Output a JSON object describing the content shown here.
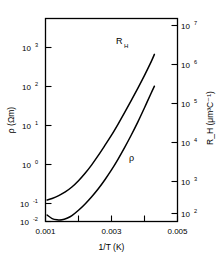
{
  "chart_data": {
    "type": "line",
    "title": "",
    "xlabel": "1/T (K)",
    "ylabel_left": "ρ (Ωm)",
    "ylabel_right": "R_H (μm³C⁻¹)",
    "xlim": [
      0.001,
      0.005
    ],
    "xticks": [
      0.001,
      0.002,
      0.003,
      0.004,
      0.005
    ],
    "xtick_labels": [
      "0.001",
      "",
      "0.003",
      "",
      "0.005"
    ],
    "left_axis": {
      "label_base": "ρ",
      "label_units": "(Ωm)",
      "scale": "log",
      "ylim": [
        0.01,
        10000
      ],
      "ticks": [
        {
          "mantissa": "10",
          "exponent": "3",
          "value": 1000
        },
        {
          "mantissa": "10",
          "exponent": "2",
          "value": 100
        },
        {
          "mantissa": "10",
          "exponent": "1",
          "value": 10
        },
        {
          "mantissa": "10",
          "exponent": "0",
          "value": 1
        },
        {
          "mantissa": "10",
          "exponent": "-1",
          "value": 0.1
        },
        {
          "mantissa": "10",
          "exponent": "-2",
          "value": 0.01
        }
      ]
    },
    "right_axis": {
      "label_base": "R",
      "label_subscript": "H",
      "label_units": "(μm³C⁻¹)",
      "scale": "log",
      "ylim": [
        10,
        100000000
      ],
      "ticks": [
        {
          "mantissa": "10",
          "exponent": "7",
          "value": 10000000
        },
        {
          "mantissa": "10",
          "exponent": "6",
          "value": 1000000
        },
        {
          "mantissa": "10",
          "exponent": "5",
          "value": 100000
        },
        {
          "mantissa": "10",
          "exponent": "4",
          "value": 10000
        },
        {
          "mantissa": "10",
          "exponent": "3",
          "value": 1000
        },
        {
          "mantissa": "10",
          "exponent": "2",
          "value": 100
        }
      ]
    },
    "grid": false,
    "legend": "inline-annotations",
    "series": [
      {
        "name": "R_H",
        "annotation": "R",
        "annotation_subscript": "H",
        "axis": "right",
        "comment": "Hall coefficient vs inverse temperature; rises steeply, exits top of frame",
        "x": [
          0.00105,
          0.0012,
          0.0014,
          0.0016,
          0.0018,
          0.002,
          0.0022,
          0.0024,
          0.0026,
          0.0028,
          0.003,
          0.0032,
          0.0034,
          0.0036,
          0.0038,
          0.004,
          0.0042,
          0.0043
        ],
        "y": [
          55,
          62,
          78,
          105,
          155,
          255,
          460,
          900,
          1900,
          4200,
          9500,
          23000,
          58000,
          150000,
          400000,
          1100000,
          3200000,
          5800000
        ]
      },
      {
        "name": "rho",
        "annotation": "ρ",
        "axis": "left",
        "comment": "Resistivity vs inverse temperature; shallow minimum near 1/T = 0.0015 then steep rise",
        "x": [
          0.00105,
          0.0012,
          0.00135,
          0.0015,
          0.00165,
          0.0018,
          0.002,
          0.0022,
          0.0024,
          0.0026,
          0.0028,
          0.003,
          0.0032,
          0.0034,
          0.0036,
          0.0038,
          0.004,
          0.0042,
          0.0043
        ],
        "y": [
          0.0155,
          0.0122,
          0.0112,
          0.0112,
          0.0125,
          0.015,
          0.0215,
          0.033,
          0.054,
          0.093,
          0.172,
          0.335,
          0.7,
          1.55,
          3.6,
          8.8,
          23.0,
          62.0,
          100.0
        ]
      }
    ]
  }
}
